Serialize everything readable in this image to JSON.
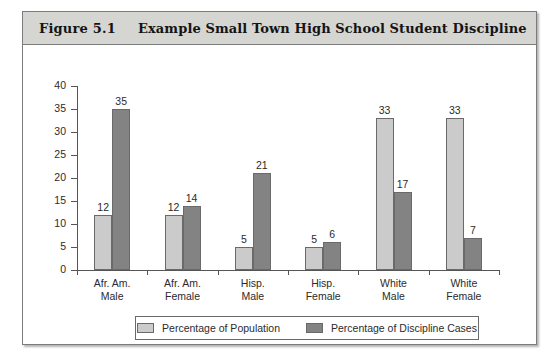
{
  "figure": {
    "number": "Figure 5.1",
    "title": "Example Small Town High School Student Discipline"
  },
  "chart_data": {
    "type": "bar",
    "title": "Example Small Town High School Student Discipline",
    "xlabel": "",
    "ylabel": "",
    "ylim": [
      0,
      40
    ],
    "yticks": [
      0,
      5,
      10,
      15,
      20,
      25,
      30,
      35,
      40
    ],
    "grid": false,
    "legend_position": "bottom",
    "categories": [
      "Afr. Am. Male",
      "Afr. Am. Female",
      "Hisp. Male",
      "Hisp. Female",
      "White Male",
      "White Female"
    ],
    "category_lines": [
      [
        "Afr. Am.",
        "Male"
      ],
      [
        "Afr. Am.",
        "Female"
      ],
      [
        "Hisp.",
        "Male"
      ],
      [
        "Hisp.",
        "Female"
      ],
      [
        "White",
        "Male"
      ],
      [
        "White",
        "Female"
      ]
    ],
    "series": [
      {
        "name": "Percentage of Population",
        "color": "#cbcbcb",
        "values": [
          12,
          12,
          5,
          5,
          33,
          33
        ]
      },
      {
        "name": "Percentage of Discipline Cases",
        "color": "#838383",
        "values": [
          35,
          14,
          21,
          6,
          17,
          7
        ]
      }
    ]
  },
  "legend": {
    "entries": [
      {
        "label": "Percentage of Population"
      },
      {
        "label": "Percentage of Discipline Cases"
      }
    ]
  }
}
